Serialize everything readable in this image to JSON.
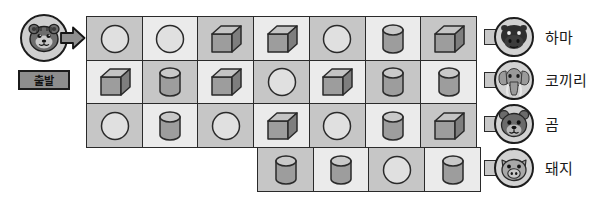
{
  "puzzle": {
    "start": {
      "label": "출발",
      "avatar_icon": "tiger-face-icon",
      "arrow_icon": "right-arrow-icon"
    },
    "grid": {
      "columns": 7,
      "shape_names": {
        "circle": "circle-shape",
        "cube": "cube-shape",
        "cylinder": "cylinder-shape"
      },
      "rows": [
        {
          "offset": 0,
          "cells": [
            "circle",
            "circle",
            "cube",
            "cube",
            "circle",
            "cylinder",
            "cube"
          ]
        },
        {
          "offset": 0,
          "cells": [
            "cube",
            "cylinder",
            "cube",
            "circle",
            "cube",
            "cylinder",
            "cylinder"
          ]
        },
        {
          "offset": 0,
          "cells": [
            "circle",
            "cylinder",
            "circle",
            "cube",
            "circle",
            "cylinder",
            "cube"
          ]
        },
        {
          "offset": 3,
          "cells": [
            "cylinder",
            "cylinder",
            "circle",
            "cylinder"
          ]
        }
      ]
    },
    "animals": [
      {
        "name": "하마",
        "icon": "hippo-face-icon"
      },
      {
        "name": "코끼리",
        "icon": "elephant-face-icon"
      },
      {
        "name": "곰",
        "icon": "bear-face-icon"
      },
      {
        "name": "돼지",
        "icon": "pig-face-icon"
      }
    ],
    "colors": {
      "cell_dark": "#c6c6c6",
      "cell_light": "#ebebeb",
      "outline": "#2a2a2a",
      "shape_fill": "#a0a0a0",
      "shape_light": "#e8e8e8",
      "connector": "#c8c8c8",
      "start_label_bg": "#8d8d8d"
    }
  }
}
